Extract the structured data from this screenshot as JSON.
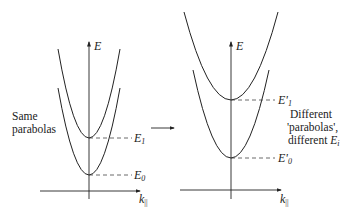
{
  "left_panel": {
    "axis_y_label": "E",
    "axis_x_label": "k",
    "axis_x_sub": "||",
    "caption_line1": "Same",
    "caption_line2": "parabolas",
    "levels": [
      {
        "label": "E",
        "sub": "1"
      },
      {
        "label": "E",
        "sub": "0"
      }
    ]
  },
  "right_panel": {
    "axis_y_label": "E",
    "axis_x_label": "k",
    "axis_x_sub": "||",
    "caption_line1": "Different",
    "caption_line2": "'parabolas',",
    "caption_line3_text": "different ",
    "caption_line3_sym": "E",
    "caption_line3_sub": "i",
    "levels": [
      {
        "label": "E'",
        "sub": "1"
      },
      {
        "label": "E'",
        "sub": "0"
      }
    ]
  },
  "colors": {
    "line": "#222222",
    "background": "#ffffff"
  }
}
